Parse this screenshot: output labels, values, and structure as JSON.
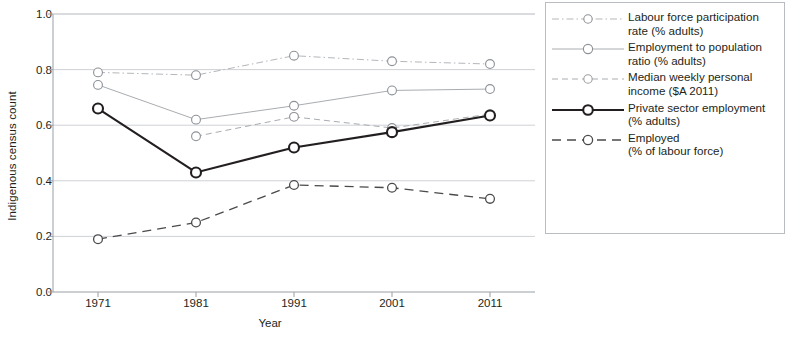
{
  "chart_data": {
    "type": "line",
    "title": "",
    "xlabel": "Year",
    "ylabel": "Indigenous census count",
    "categories": [
      "1971",
      "1981",
      "1991",
      "2001",
      "2011"
    ],
    "x": [
      1971,
      1981,
      1991,
      2001,
      2011
    ],
    "ylim": [
      0.0,
      1.0
    ],
    "xlim": [
      1966,
      2016
    ],
    "yticks": [
      "0.0",
      "0.2",
      "0.4",
      "0.6",
      "0.8",
      "1.0"
    ],
    "ytick_values": [
      0.0,
      0.2,
      0.4,
      0.6,
      0.8,
      1.0
    ],
    "grid": true,
    "grid_axis": "y",
    "legend_position": "right",
    "series": [
      {
        "name": "Labour force participation rate (% adults)",
        "label_line1": "Labour force participation",
        "label_line2": "rate (% adults)",
        "values": [
          0.79,
          0.78,
          0.85,
          0.83,
          0.82
        ],
        "color": "#b4b7bb",
        "style": "dash-dot",
        "width": 1.0,
        "marker": "circle-open"
      },
      {
        "name": "Employment to population ratio (% adults)",
        "label_line1": "Employment to population",
        "label_line2": "ratio (% adults)",
        "values": [
          0.745,
          0.62,
          0.67,
          0.725,
          0.73
        ],
        "color": "#a9acb0",
        "style": "solid",
        "width": 1.0,
        "marker": "circle-open"
      },
      {
        "name": "Median weekly personal income ($A 2011)",
        "label_line1": "Median weekly personal",
        "label_line2": "income ($A 2011)",
        "values": [
          null,
          0.56,
          0.63,
          0.59,
          0.64
        ],
        "color": "#a9acb0",
        "style": "dashed",
        "width": 1.0,
        "marker": "circle-open"
      },
      {
        "name": "Private sector employment (% adults)",
        "label_line1": "Private sector employment",
        "label_line2": "(% adults)",
        "values": [
          0.66,
          0.43,
          0.52,
          0.575,
          0.635
        ],
        "color": "#231f20",
        "style": "solid",
        "width": 2.1,
        "marker": "circle-open-bold"
      },
      {
        "name": "Employed (% of labour force)",
        "label_line1": "Employed",
        "label_line2": "(% of labour force)",
        "values": [
          0.19,
          0.25,
          0.385,
          0.375,
          0.335
        ],
        "color": "#4a4a4c",
        "style": "dashed-long",
        "width": 1.3,
        "marker": "circle-open"
      }
    ]
  },
  "axes": {
    "ylabel": "Indigenous census count",
    "xlabel": "Year"
  },
  "colors": {
    "axis": "#8c9196",
    "grid": "#c9ccd0",
    "text": "#231f20",
    "legend_border": "#b9bcc0",
    "accent_dark": "#231f20"
  }
}
